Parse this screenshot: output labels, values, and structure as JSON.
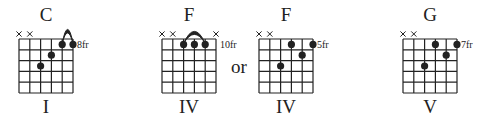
{
  "colors": {
    "ink": "#222222",
    "background": "#ffffff"
  },
  "separator": {
    "label": "or"
  },
  "chords": [
    {
      "name": "C",
      "numeral": "I",
      "fret_label": "8fr",
      "center_x": 46,
      "grid_left": 19,
      "muted_strings": [
        6,
        5
      ],
      "dots": [
        {
          "string": 4,
          "fret": 3
        },
        {
          "string": 3,
          "fret": 2
        },
        {
          "string": 2,
          "fret": 1
        },
        {
          "string": 1,
          "fret": 1
        }
      ],
      "barre": {
        "from_string": 2,
        "to_string": 1
      }
    },
    {
      "name": "F",
      "numeral": "IV",
      "fret_label": "10fr",
      "center_x": 189,
      "grid_left": 162,
      "muted_strings": [
        6,
        5,
        1
      ],
      "dots": [
        {
          "string": 4,
          "fret": 1
        },
        {
          "string": 3,
          "fret": 1
        },
        {
          "string": 2,
          "fret": 1
        }
      ],
      "barre": {
        "from_string": 4,
        "to_string": 2
      }
    },
    {
      "name": "F",
      "numeral": "IV",
      "fret_label": "5fr",
      "center_x": 286,
      "grid_left": 259,
      "muted_strings": [
        6,
        5
      ],
      "dots": [
        {
          "string": 4,
          "fret": 3
        },
        {
          "string": 3,
          "fret": 1
        },
        {
          "string": 2,
          "fret": 2
        },
        {
          "string": 1,
          "fret": 1
        }
      ],
      "barre": null
    },
    {
      "name": "G",
      "numeral": "V",
      "fret_label": "7fr",
      "center_x": 430,
      "grid_left": 403,
      "muted_strings": [
        6,
        5
      ],
      "dots": [
        {
          "string": 4,
          "fret": 3
        },
        {
          "string": 3,
          "fret": 1
        },
        {
          "string": 2,
          "fret": 2
        },
        {
          "string": 1,
          "fret": 1
        }
      ],
      "barre": null
    }
  ]
}
